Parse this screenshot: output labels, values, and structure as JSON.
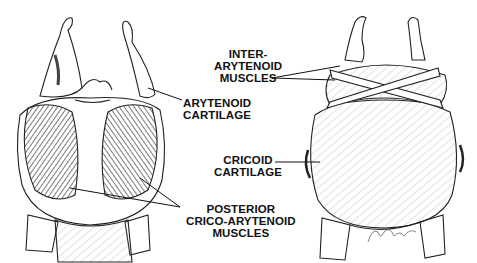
{
  "figure": {
    "views": [
      {
        "id": "left",
        "description": "posterior view of larynx with muscles exposed"
      },
      {
        "id": "right",
        "description": "posterior view of larynx with interarytenoid muscles"
      }
    ],
    "labels": {
      "inter_arytenoid": {
        "line1": "INTER-",
        "line2": "ARYTENOID",
        "line3": "MUSCLES"
      },
      "arytenoid_cartilage": {
        "line1": "ARYTENOID",
        "line2": "CARTILAGE"
      },
      "cricoid_cartilage": {
        "line1": "CRICOID",
        "line2": "CARTILAGE"
      },
      "posterior_crico_arytenoid": {
        "line1": "POSTERIOR",
        "line2": "CRICO-ARYTENOID",
        "line3": "MUSCLES"
      }
    },
    "colors": {
      "ink": "#111111",
      "background": "#ffffff",
      "shade": "#555555"
    }
  }
}
